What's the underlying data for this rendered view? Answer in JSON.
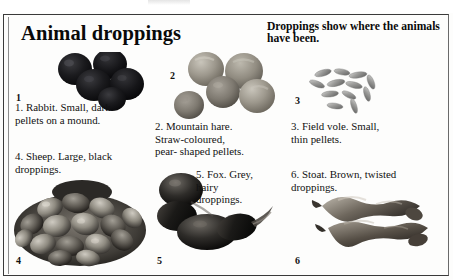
{
  "page": {
    "title": "Animal droppings",
    "subheading": "Droppings show where the animals have been."
  },
  "entries": [
    {
      "number": "1",
      "number_label": "1",
      "caption_line1": "1. Rabbit. Small, dark",
      "caption_line2": "pellets on a mound.",
      "caption_line3": "",
      "subject": "Rabbit",
      "photo_name": "rabbit-droppings-photo",
      "tone": "#141414"
    },
    {
      "number": "2",
      "number_label": "2",
      "caption_line1": "2. Mountain hare.",
      "caption_line2": "Straw-coloured,",
      "caption_line3": "pear- shaped pellets.",
      "subject": "Mountain hare",
      "photo_name": "mountain-hare-droppings-photo",
      "tone": "#8e8a82"
    },
    {
      "number": "3",
      "number_label": "3",
      "caption_line1": "3. Field vole. Small,",
      "caption_line2": "thin pellets.",
      "caption_line3": "",
      "subject": "Field vole",
      "photo_name": "field-vole-droppings-photo",
      "tone": "#9a9a98"
    },
    {
      "number": "4",
      "number_label": "4",
      "caption_line1": "4. Sheep. Large, black",
      "caption_line2": "droppings.",
      "caption_line3": "",
      "subject": "Sheep",
      "photo_name": "sheep-droppings-photo",
      "tone": "#4a4a47"
    },
    {
      "number": "5",
      "number_label": "5",
      "caption_line1": "5. Fox. Grey,",
      "caption_line2": "hairy",
      "caption_line3": "droppings.",
      "subject": "Fox",
      "photo_name": "fox-droppings-photo",
      "tone": "#2c2c2c"
    },
    {
      "number": "6",
      "number_label": "6",
      "caption_line1": "6. Stoat. Brown, twisted",
      "caption_line2": "droppings.",
      "caption_line3": "",
      "subject": "Stoat",
      "photo_name": "stoat-droppings-photo",
      "tone": "#5c564e"
    }
  ],
  "colors": {
    "page_background": "#fdfdfc",
    "text": "#111111",
    "frame_border": "#3a3a3a"
  }
}
